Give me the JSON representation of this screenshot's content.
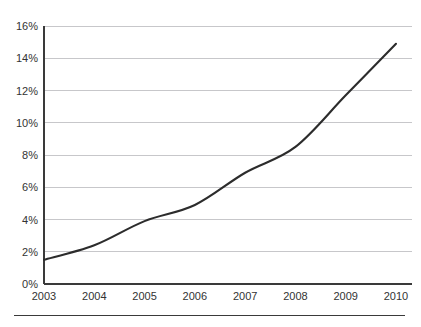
{
  "figure": {
    "top_clipped_text": "",
    "background_color": "#ffffff",
    "line_color": "#2c2c2c",
    "grid_color": "#b9b9bd",
    "axis_color": "#3a3a3a"
  },
  "chart_data": {
    "type": "line",
    "title": "",
    "subtitle": "",
    "xlabel": "",
    "ylabel": "",
    "categories": [
      "2003",
      "2004",
      "2005",
      "2006",
      "2007",
      "2008",
      "2009",
      "2010"
    ],
    "x": [
      2003,
      2004,
      2005,
      2006,
      2007,
      2008,
      2009,
      2010
    ],
    "values": [
      1.5,
      2.4,
      3.9,
      4.9,
      6.9,
      8.5,
      11.7,
      14.9
    ],
    "series": [
      {
        "name": "",
        "values": [
          1.5,
          2.4,
          3.9,
          4.9,
          6.9,
          8.5,
          11.7,
          14.9
        ]
      }
    ],
    "ylim": [
      0,
      16
    ],
    "xlim": [
      2003,
      2010
    ],
    "ytick_labels": [
      "0%",
      "2%",
      "4%",
      "6%",
      "8%",
      "10%",
      "12%",
      "14%",
      "16%"
    ],
    "ytick_values": [
      0,
      2,
      4,
      6,
      8,
      10,
      12,
      14,
      16
    ],
    "xtick_labels": [
      "2003",
      "2004",
      "2005",
      "2006",
      "2007",
      "2008",
      "2009",
      "2010"
    ],
    "grid": "horizontal",
    "legend": "none",
    "annotations": []
  },
  "axes": {
    "y": {
      "ticks": [
        {
          "label": "16%",
          "value": 16
        },
        {
          "label": "14%",
          "value": 14
        },
        {
          "label": "12%",
          "value": 12
        },
        {
          "label": "10%",
          "value": 10
        },
        {
          "label": "8%",
          "value": 8
        },
        {
          "label": "6%",
          "value": 6
        },
        {
          "label": "4%",
          "value": 4
        },
        {
          "label": "2%",
          "value": 2
        },
        {
          "label": "0%",
          "value": 0
        }
      ]
    },
    "x": {
      "ticks": [
        {
          "label": "2003"
        },
        {
          "label": "2004"
        },
        {
          "label": "2005"
        },
        {
          "label": "2006"
        },
        {
          "label": "2007"
        },
        {
          "label": "2008"
        },
        {
          "label": "2009"
        },
        {
          "label": "2010"
        }
      ]
    }
  }
}
